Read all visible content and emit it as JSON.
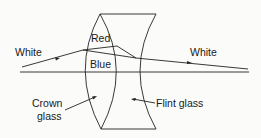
{
  "diagram": {
    "labels": {
      "white_in": "White",
      "white_out": "White",
      "red": "Red",
      "blue": "Blue",
      "crown_line1": "Crown",
      "crown_line2": "glass",
      "flint": "Flint glass"
    },
    "colors": {
      "stroke": "#222222",
      "background": "#fbfbfa"
    }
  }
}
